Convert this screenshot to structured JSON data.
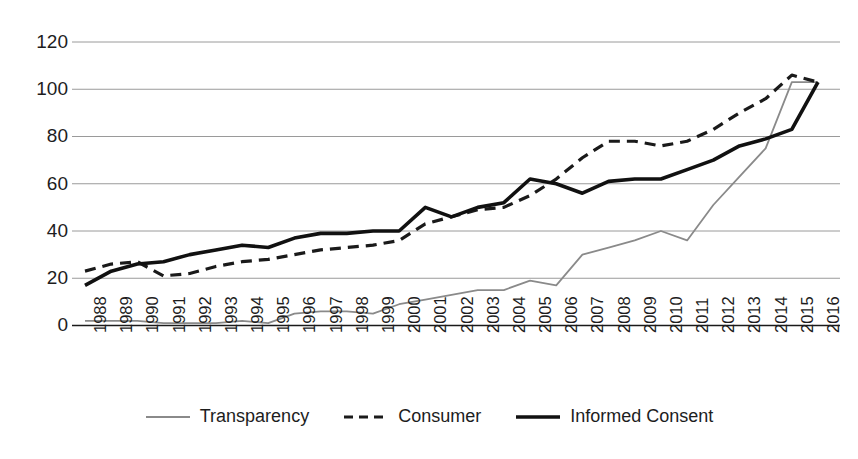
{
  "chart_data": {
    "type": "line",
    "title": "",
    "xlabel": "",
    "ylabel": "",
    "ylim": [
      0,
      120
    ],
    "yticks": [
      0,
      20,
      40,
      60,
      80,
      100,
      120
    ],
    "grid": true,
    "legend_position": "bottom",
    "x": [
      1988,
      1989,
      1990,
      1991,
      1992,
      1993,
      1994,
      1995,
      1996,
      1997,
      1998,
      1999,
      2000,
      2001,
      2002,
      2003,
      2004,
      2005,
      2006,
      2007,
      2008,
      2009,
      2010,
      2011,
      2012,
      2013,
      2014,
      2015,
      2016
    ],
    "categories": [
      "1988",
      "1989",
      "1990",
      "1991",
      "1992",
      "1993",
      "1994",
      "1995",
      "1996",
      "1997",
      "1998",
      "1999",
      "2000",
      "2001",
      "2002",
      "2003",
      "2004",
      "2005",
      "2006",
      "2007",
      "2008",
      "2009",
      "2010",
      "2011",
      "2012",
      "2013",
      "2014",
      "2015",
      "2016"
    ],
    "series": [
      {
        "name": "Transparency",
        "style": "solid",
        "color": "#8a8a8a",
        "width": 1.8,
        "values": [
          2,
          2,
          2,
          1,
          1,
          1,
          2,
          1,
          5,
          6,
          6,
          5,
          9,
          11,
          13,
          15,
          15,
          19,
          17,
          30,
          33,
          36,
          40,
          36,
          51,
          63,
          75,
          103,
          103
        ]
      },
      {
        "name": "Consumer",
        "style": "dashed",
        "color": "#1a1a1a",
        "width": 3.2,
        "values": [
          23,
          26,
          27,
          21,
          22,
          25,
          27,
          28,
          30,
          32,
          33,
          34,
          36,
          43,
          46,
          49,
          50,
          55,
          62,
          71,
          78,
          78,
          76,
          78,
          83,
          90,
          96,
          106,
          103
        ]
      },
      {
        "name": "Informed Consent",
        "style": "solid",
        "color": "#111111",
        "width": 3.6,
        "values": [
          17,
          23,
          26,
          27,
          30,
          32,
          34,
          33,
          37,
          39,
          39,
          40,
          40,
          50,
          46,
          50,
          52,
          62,
          60,
          56,
          61,
          62,
          62,
          66,
          70,
          76,
          79,
          83,
          103
        ]
      }
    ]
  },
  "axes": {
    "y_labels": [
      "120",
      "100",
      "80",
      "60",
      "40",
      "20",
      "0"
    ],
    "x_labels": [
      "1988",
      "1989",
      "1990",
      "1991",
      "1992",
      "1993",
      "1994",
      "1995",
      "1996",
      "1997",
      "1998",
      "1999",
      "2000",
      "2001",
      "2002",
      "2003",
      "2004",
      "2005",
      "2006",
      "2007",
      "2008",
      "2009",
      "2010",
      "2011",
      "2012",
      "2013",
      "2014",
      "2015",
      "2016"
    ]
  },
  "legend": {
    "items": [
      {
        "label": "Transparency",
        "icon": "line-solid-gray-icon"
      },
      {
        "label": "Consumer",
        "icon": "line-dashed-black-icon"
      },
      {
        "label": "Informed Consent",
        "icon": "line-solid-black-icon"
      }
    ]
  },
  "colors": {
    "gridline": "#9a9a9a",
    "axis": "#1a1a1a",
    "transparency": "#8a8a8a",
    "consumer": "#1a1a1a",
    "informed_consent": "#111111",
    "background": "#ffffff"
  }
}
